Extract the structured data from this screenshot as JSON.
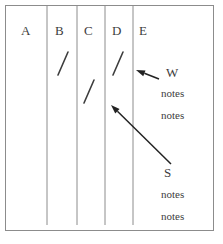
{
  "figure": {
    "type": "tally-table-annotated",
    "background_color": "#ffffff",
    "ink_color": "#3d3d3d",
    "rule_color": "#8c8c8c"
  },
  "columns": [
    {
      "label": "A",
      "x": 21,
      "tally_count": 0
    },
    {
      "label": "B",
      "x": 55,
      "tally_count": 1
    },
    {
      "label": "C",
      "x": 84,
      "tally_count": 1
    },
    {
      "label": "D",
      "x": 112,
      "tally_count": 1
    },
    {
      "label": "E",
      "x": 139,
      "tally_count": 0
    }
  ],
  "column_rules_x": [
    47,
    77,
    105,
    133
  ],
  "tally_marks": [
    {
      "column": "B",
      "x1": 58,
      "y1": 75,
      "x2": 68,
      "y2": 52
    },
    {
      "column": "C",
      "x1": 84,
      "y1": 103,
      "x2": 94,
      "y2": 80
    },
    {
      "column": "D",
      "x1": 113,
      "y1": 75,
      "x2": 123,
      "y2": 52
    }
  ],
  "annotations": [
    {
      "id": "w",
      "label": "W",
      "label_x": 166,
      "label_y": 66,
      "notes": [
        "notes",
        "notes"
      ],
      "notes_x": 161,
      "notes_y": [
        88,
        110
      ],
      "arrow": {
        "tail_x": 159,
        "tail_y": 79,
        "tip_x": 136,
        "tip_y": 70
      }
    },
    {
      "id": "s",
      "label": "S",
      "label_x": 164,
      "label_y": 166,
      "notes": [
        "notes",
        "notes"
      ],
      "notes_x": 161,
      "notes_y": [
        189,
        211
      ],
      "arrow": {
        "tail_x": 171,
        "tail_y": 164,
        "tip_x": 111,
        "tip_y": 105
      }
    }
  ],
  "frame": {
    "x": 5,
    "y": 5,
    "width": 209,
    "height": 226,
    "rule_top": 5,
    "rule_bottom": 225
  }
}
